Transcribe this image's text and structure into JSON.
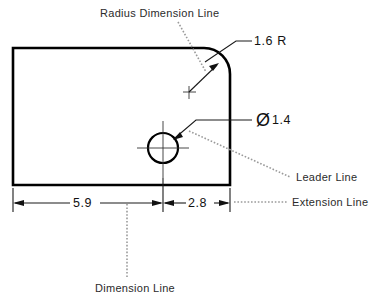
{
  "figure": {
    "type": "engineering-drawing",
    "background_color": "#ffffff",
    "line_color": "#000000",
    "callout_color": "#9a9a9a"
  },
  "annotations": {
    "radius_dimension_line": "Radius Dimension Line",
    "leader_line": "Leader Line",
    "extension_line": "Extension Line",
    "dimension_line": "Dimension Line"
  },
  "dimensions": {
    "radius": "1.6 R",
    "diameter_symbol": "Ø",
    "diameter_value": "1.4",
    "length_left": "5.9",
    "length_right": "2.8"
  },
  "geometry": {
    "plate": {
      "left": 13,
      "top": 48,
      "right": 230,
      "bottom": 185,
      "corner_radius": 26
    },
    "hole": {
      "center_x": 163,
      "center_y": 148,
      "radius": 15
    },
    "radius_center": {
      "x": 189,
      "y": 92
    },
    "dimension_line_y": 203
  }
}
